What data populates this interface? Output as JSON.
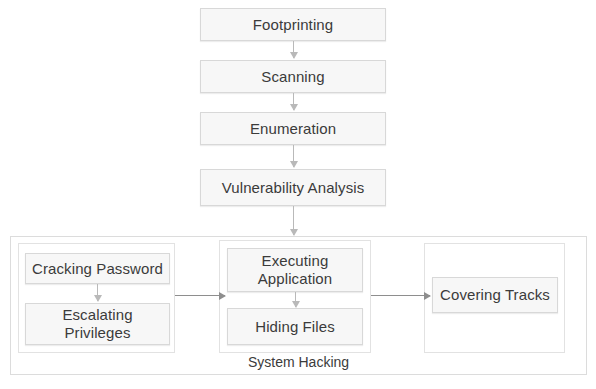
{
  "diagram": {
    "colors": {
      "node_fill": "#f7f7f7",
      "node_border": "#d8d8d8",
      "container_border": "#dcdcdc",
      "arrow_vertical": "#b9b9b9",
      "arrow_horizontal": "#8e8e8e",
      "text": "#3b3b3b",
      "background": "#ffffff"
    },
    "pipeline": [
      {
        "id": "footprinting",
        "label": "Footprinting"
      },
      {
        "id": "scanning",
        "label": "Scanning"
      },
      {
        "id": "enumeration",
        "label": "Enumeration"
      },
      {
        "id": "vulnerability-analysis",
        "label": "Vulnerability Analysis"
      }
    ],
    "container": {
      "id": "system-hacking",
      "label": "System Hacking"
    },
    "groups": [
      {
        "id": "gaining-access",
        "nodes": [
          {
            "id": "cracking-password",
            "label": "Cracking Password"
          },
          {
            "id": "escalating-privileges",
            "label": "Escalating\nPrivileges"
          }
        ]
      },
      {
        "id": "maintaining-access",
        "nodes": [
          {
            "id": "executing-application",
            "label": "Executing\nApplication"
          },
          {
            "id": "hiding-files",
            "label": "Hiding Files"
          }
        ]
      },
      {
        "id": "covering",
        "nodes": [
          {
            "id": "covering-tracks",
            "label": "Covering Tracks"
          }
        ]
      }
    ],
    "connectors": [
      {
        "id": "footprinting-to-scanning",
        "from": "footprinting",
        "to": "scanning",
        "direction": "down"
      },
      {
        "id": "scanning-to-enumeration",
        "from": "scanning",
        "to": "enumeration",
        "direction": "down"
      },
      {
        "id": "enumeration-to-vulnerability-analysis",
        "from": "enumeration",
        "to": "vulnerability-analysis",
        "direction": "down"
      },
      {
        "id": "vulnerability-analysis-to-system-hacking",
        "from": "vulnerability-analysis",
        "to": "system-hacking",
        "direction": "down"
      },
      {
        "id": "cracking-password-to-escalating-privileges",
        "from": "cracking-password",
        "to": "escalating-privileges",
        "direction": "down"
      },
      {
        "id": "executing-application-to-hiding-files",
        "from": "executing-application",
        "to": "hiding-files",
        "direction": "down"
      },
      {
        "id": "gaining-access-to-maintaining-access",
        "from": "gaining-access",
        "to": "maintaining-access",
        "direction": "right"
      },
      {
        "id": "maintaining-access-to-covering",
        "from": "maintaining-access",
        "to": "covering-tracks",
        "direction": "right"
      }
    ]
  }
}
